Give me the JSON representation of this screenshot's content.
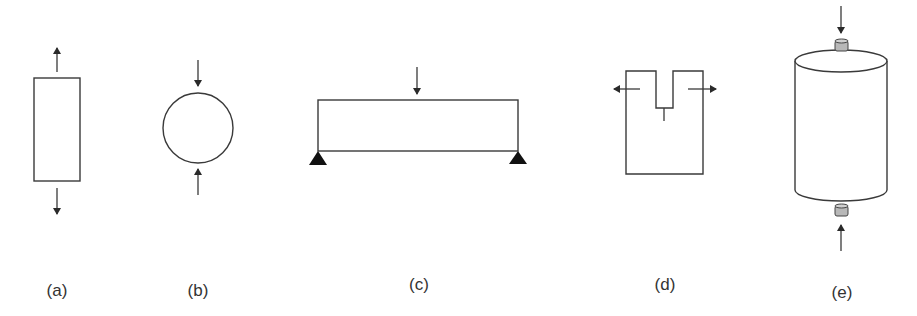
{
  "figure": {
    "panels": [
      {
        "id": "a",
        "label": "(a)",
        "description": "Rectangular specimen under uniaxial tension"
      },
      {
        "id": "b",
        "label": "(b)",
        "description": "Circular disk under diametral compression"
      },
      {
        "id": "c",
        "label": "(c)",
        "description": "Simply supported beam under central point load"
      },
      {
        "id": "d",
        "label": "(d)",
        "description": "Notched compact specimen under opening load"
      },
      {
        "id": "e",
        "label": "(e)",
        "description": "Cylindrical specimen under axial compression between platens"
      }
    ]
  },
  "colors": {
    "line": "#3a3a3a",
    "support": "#111111",
    "platen": "#b8b8b8",
    "background": "#ffffff"
  }
}
